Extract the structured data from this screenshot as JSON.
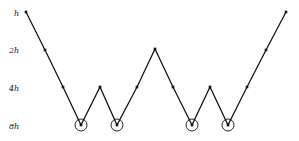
{
  "figure": {
    "title": "",
    "background_color": "#ffffff",
    "line_color": "#111111",
    "marker_color": "#111111",
    "circle_color": "#111111"
  },
  "axis": {
    "tick_labels": [
      {
        "text": "h",
        "x": 14,
        "y": 16
      },
      {
        "text": "2h",
        "x": 9,
        "y": 53
      },
      {
        "text": "4h",
        "x": 9,
        "y": 91
      },
      {
        "text": "8h",
        "x": 9,
        "y": 129
      }
    ]
  },
  "chart_data": {
    "type": "line",
    "title": "",
    "xlabel": "",
    "ylabel": "",
    "grid": false,
    "legend": false,
    "y_tick_labels": [
      "h",
      "2h",
      "4h",
      "8h"
    ],
    "y_tick_pixels": [
      12,
      49,
      87,
      125
    ],
    "x": [
      26,
      45,
      63,
      81,
      100,
      117,
      137,
      155,
      173,
      192,
      210,
      228,
      247,
      266,
      286
    ],
    "y": [
      12,
      50,
      87,
      125,
      87,
      125,
      87,
      49,
      87,
      125,
      87,
      125,
      87,
      50,
      12
    ],
    "levels": [
      "h",
      "2h",
      "4h",
      "8h",
      "4h",
      "8h",
      "4h",
      "2h",
      "4h",
      "8h",
      "4h",
      "8h",
      "4h",
      "2h",
      "h"
    ],
    "vertices": [
      {
        "x": 26,
        "y": 12,
        "level": "h",
        "kind": "endpoint"
      },
      {
        "x": 45,
        "y": 50,
        "level": "2h",
        "kind": "waypoint"
      },
      {
        "x": 63,
        "y": 87,
        "level": "4h",
        "kind": "waypoint"
      },
      {
        "x": 81,
        "y": 125,
        "level": "8h",
        "kind": "minimum"
      },
      {
        "x": 100,
        "y": 87,
        "level": "4h",
        "kind": "local-max"
      },
      {
        "x": 117,
        "y": 125,
        "level": "8h",
        "kind": "minimum"
      },
      {
        "x": 137,
        "y": 87,
        "level": "4h",
        "kind": "waypoint"
      },
      {
        "x": 155,
        "y": 49,
        "level": "2h",
        "kind": "local-max"
      },
      {
        "x": 173,
        "y": 87,
        "level": "4h",
        "kind": "waypoint"
      },
      {
        "x": 192,
        "y": 125,
        "level": "8h",
        "kind": "minimum"
      },
      {
        "x": 210,
        "y": 87,
        "level": "4h",
        "kind": "local-max"
      },
      {
        "x": 228,
        "y": 125,
        "level": "8h",
        "kind": "minimum"
      },
      {
        "x": 247,
        "y": 87,
        "level": "4h",
        "kind": "waypoint"
      },
      {
        "x": 266,
        "y": 50,
        "level": "2h",
        "kind": "waypoint"
      },
      {
        "x": 286,
        "y": 12,
        "level": "h",
        "kind": "endpoint"
      }
    ],
    "highlighted_minima": [
      {
        "x": 81,
        "y": 125,
        "radius": 6
      },
      {
        "x": 117,
        "y": 125,
        "radius": 6
      },
      {
        "x": 192,
        "y": 125,
        "radius": 6
      },
      {
        "x": 228,
        "y": 125,
        "radius": 6
      }
    ]
  }
}
